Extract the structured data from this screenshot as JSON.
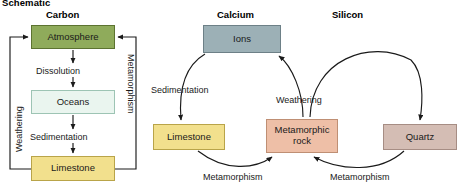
{
  "schematic": {
    "title": "Schematic"
  },
  "columns": [
    {
      "id": "carbon",
      "title": "Carbon"
    },
    {
      "id": "calcium",
      "title": "Calcium"
    },
    {
      "id": "silicon",
      "title": "Silicon"
    }
  ],
  "carbon_cycle": {
    "boxes": {
      "atmosphere": {
        "label": "Atmosphere",
        "fill": "#8fab5b",
        "border": "#5c7330"
      },
      "oceans": {
        "label": "Oceans",
        "fill": "#eaf5ef",
        "border": "#9dc4b4"
      },
      "limestone": {
        "label": "Limestone",
        "fill": "#f2e08d",
        "border": "#b9a449"
      }
    },
    "processes": {
      "dissolution": "Dissolution",
      "sedimentation": "Sedimentation",
      "weathering": "Weathering",
      "metamorphism": "Metamorphism"
    }
  },
  "calcium_cycle": {
    "boxes": {
      "ions": {
        "label": "Ions",
        "fill": "#9cb0b6",
        "border": "#6d8087"
      },
      "limestone": {
        "label": "Limestone",
        "fill": "#f2e08d",
        "border": "#b9a449"
      },
      "metamorphic": {
        "label": "Metamorphic\nrock",
        "fill": "#eebfa7",
        "border": "#bf8f74"
      }
    },
    "processes": {
      "sedimentation": "Sedimentation",
      "weathering": "Weathering",
      "metamorphism": "Metamorphism"
    }
  },
  "silicon_cycle": {
    "boxes": {
      "quartz": {
        "label": "Quartz",
        "fill": "#d4bdb4",
        "border": "#a68d84"
      },
      "metamorphic": {
        "label": "Metamorphic\nrock",
        "fill": "#eebfa7",
        "border": "#bf8f74"
      }
    },
    "processes": {
      "weathering": "Weathering",
      "metamorphism": "Metamorphism"
    }
  },
  "diagram_meta": {
    "stroke_color": "#1a1a1a",
    "background": "#ffffff"
  }
}
